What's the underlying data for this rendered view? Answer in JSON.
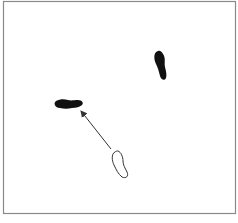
{
  "diagram": {
    "type": "footprint-step-diagram",
    "frame": {
      "x": 3,
      "y": 1,
      "width": 233,
      "height": 213,
      "stroke": "#8a8a8a"
    },
    "colors": {
      "background": "#ffffff",
      "filled_foot": "#111111",
      "outline_foot_stroke": "#333333",
      "arrow": "#333333"
    },
    "elements": [
      {
        "id": "foot-top-right",
        "kind": "filled-footprint",
        "description": "filled foot, vertical, upper right"
      },
      {
        "id": "foot-left",
        "kind": "filled-footprint",
        "description": "filled foot, horizontal, pointing left"
      },
      {
        "id": "foot-outline",
        "kind": "outlined-footprint",
        "description": "open/outlined foot, lower center (starting position)"
      },
      {
        "id": "step-arrow",
        "kind": "arrow",
        "from": "foot-outline",
        "to": "foot-left",
        "description": "arrow showing movement of the foot"
      }
    ]
  }
}
